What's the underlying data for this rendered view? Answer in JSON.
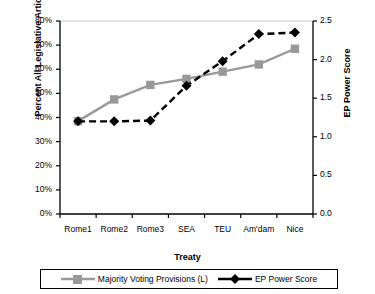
{
  "chart_data": {
    "type": "line",
    "title": "",
    "xlabel": "Treaty",
    "ylabel": "Percent All Legislative Articles",
    "ylabel_secondary": "EP Power Score",
    "categories": [
      "Rome1",
      "Rome2",
      "Rome3",
      "SEA",
      "TEU",
      "Am'dam",
      "Nice"
    ],
    "ylim": [
      0,
      80
    ],
    "yticks": [
      "0%",
      "10%",
      "20%",
      "30%",
      "40%",
      "50%",
      "60%",
      "70%",
      "80%"
    ],
    "ytick_values": [
      0,
      10,
      20,
      30,
      40,
      50,
      60,
      70,
      80
    ],
    "ylim_secondary": [
      0,
      2.5
    ],
    "yticks_secondary": [
      "0.0",
      "0.5",
      "1.0",
      "1.5",
      "2.0",
      "2.5"
    ],
    "ytick_values_secondary": [
      0,
      0.5,
      1.0,
      1.5,
      2.0,
      2.5
    ],
    "grid": false,
    "legend_position": "bottom",
    "series": [
      {
        "name": "Majority Voting Provisions (L)",
        "axis": "left",
        "color": "#999999",
        "marker": "square",
        "linestyle": "solid",
        "values": [
          38.5,
          47.5,
          53.5,
          56.0,
          59.0,
          62.0,
          68.5
        ]
      },
      {
        "name": "EP Power Score",
        "axis": "right",
        "color": "#000000",
        "marker": "diamond",
        "linestyle": "dashed",
        "values": [
          1.2,
          1.2,
          1.21,
          1.66,
          1.98,
          2.33,
          2.35
        ]
      }
    ]
  },
  "legend": {
    "items": [
      {
        "label": "Majority Voting Provisions (L)",
        "marker": "square-marker",
        "color": "#999999"
      },
      {
        "label": "EP Power Score",
        "marker": "diamond-marker",
        "color": "#000000"
      }
    ]
  }
}
